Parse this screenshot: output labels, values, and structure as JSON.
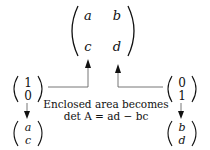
{
  "matrix": {
    "entries": {
      "a": "a",
      "b": "b",
      "c": "c",
      "d": "d"
    }
  },
  "vectors": {
    "e1": {
      "top": "1",
      "bottom": "0"
    },
    "e2": {
      "top": "0",
      "bottom": "1"
    },
    "col1": {
      "top": "a",
      "bottom": "c"
    },
    "col2": {
      "top": "b",
      "bottom": "d"
    }
  },
  "caption": {
    "line1": "Enclosed area becomes",
    "line2": "det A = ad − bc"
  },
  "colors": {
    "ink": "#111111",
    "line": "#555555",
    "background": "#ffffff"
  }
}
